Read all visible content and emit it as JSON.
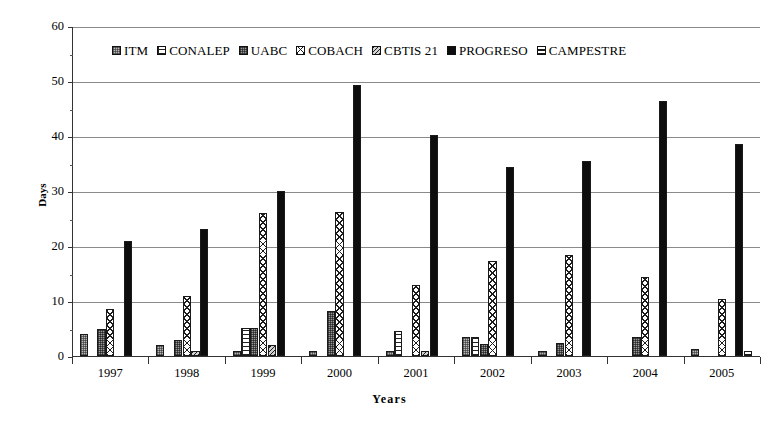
{
  "chart_data": {
    "type": "bar",
    "title": "",
    "xlabel": "Years",
    "ylabel": "Days",
    "ylim": [
      0,
      60
    ],
    "ytick_step": 10,
    "yticks": [
      "0",
      "10",
      "20",
      "30",
      "40",
      "50",
      "60"
    ],
    "grid": "horizontal",
    "legend_position": "top-inside",
    "categories": [
      "1997",
      "1998",
      "1999",
      "2000",
      "2001",
      "2002",
      "2003",
      "2004",
      "2005"
    ],
    "series": [
      {
        "name": "ITM",
        "pattern": "fill-itm",
        "values": [
          4.0,
          2.0,
          1.0,
          1.0,
          1.0,
          3.5,
          1.0,
          0.0,
          1.3
        ]
      },
      {
        "name": "CONALEP",
        "pattern": "fill-conalep",
        "values": [
          0.0,
          0.0,
          5.1,
          0.0,
          4.5,
          3.5,
          0.0,
          0.0,
          0.0
        ]
      },
      {
        "name": "UABC",
        "pattern": "fill-uabc",
        "values": [
          5.0,
          3.0,
          5.1,
          8.1,
          0.0,
          2.1,
          2.3,
          3.4,
          0.0
        ]
      },
      {
        "name": "COBACH",
        "pattern": "fill-cobach",
        "values": [
          8.5,
          11.0,
          26.0,
          26.2,
          13.0,
          17.3,
          18.4,
          14.4,
          10.4
        ]
      },
      {
        "name": "CBTIS 21",
        "pattern": "fill-cbtis",
        "values": [
          0.0,
          1.0,
          2.0,
          0.0,
          1.0,
          0.0,
          0.0,
          0.0,
          0.0
        ]
      },
      {
        "name": "PROGRESO",
        "pattern": "fill-progreso",
        "values": [
          21.0,
          23.1,
          30.0,
          49.3,
          40.2,
          34.3,
          35.4,
          46.4,
          38.5
        ]
      },
      {
        "name": "CAMPESTRE",
        "pattern": "fill-campestre",
        "values": [
          0.0,
          0.0,
          0.0,
          0.0,
          0.0,
          0.0,
          0.0,
          0.0,
          1.0
        ]
      }
    ]
  },
  "axes": {
    "y_title": "Days",
    "x_title": "Years"
  },
  "legend": {
    "items": [
      {
        "label": "ITM"
      },
      {
        "label": "CONALEP"
      },
      {
        "label": "UABC"
      },
      {
        "label": "COBACH"
      },
      {
        "label": "CBTIS 21"
      },
      {
        "label": "PROGRESO"
      },
      {
        "label": "CAMPESTRE"
      }
    ]
  }
}
